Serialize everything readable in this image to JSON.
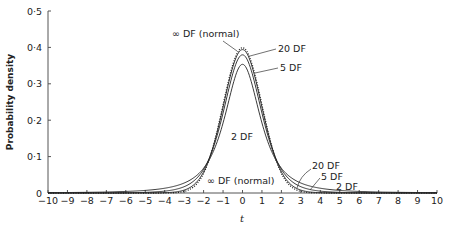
{
  "chart_data": {
    "type": "line",
    "title": "",
    "xlabel": "t",
    "ylabel": "Probability density",
    "xlim": [
      -10,
      10
    ],
    "ylim": [
      0,
      0.5
    ],
    "x_ticks": [
      "−10",
      "−9",
      "−8",
      "−7",
      "−6",
      "−5",
      "−4",
      "−3",
      "−2",
      "−1",
      "0",
      "1",
      "2",
      "3",
      "4",
      "5",
      "6",
      "7",
      "8",
      "9",
      "10"
    ],
    "y_ticks": [
      "0",
      "0·1",
      "0·2",
      "0·3",
      "0·4",
      "0·5"
    ],
    "grid": false,
    "legend": "none (inline annotations)",
    "series": [
      {
        "name": "∞ DF (normal)",
        "df": "inf",
        "peak": 0.399,
        "style": "dotted"
      },
      {
        "name": "20 DF",
        "df": 20,
        "peak": 0.394,
        "style": "solid"
      },
      {
        "name": "5 DF",
        "df": 5,
        "peak": 0.38,
        "style": "solid"
      },
      {
        "name": "2 DF",
        "df": 2,
        "peak": 0.354,
        "style": "solid"
      }
    ],
    "annotations": [
      {
        "text": "∞ DF (normal)",
        "position": "top, pointing to peak"
      },
      {
        "text": "20 DF",
        "position": "right of peak"
      },
      {
        "text": "5 DF",
        "position": "right of peak"
      },
      {
        "text": "2 DF",
        "position": "inside curve near center"
      },
      {
        "text": "∞ DF (normal)",
        "position": "near base, center"
      },
      {
        "text": "20 DF",
        "position": "right tail"
      },
      {
        "text": "5 DF",
        "position": "right tail"
      },
      {
        "text": "2 DF",
        "position": "right tail"
      }
    ]
  },
  "labels": {
    "ylabel": "Probability density",
    "xlabel": "t",
    "top_normal": "∞ DF (normal)",
    "top_20": "20 DF",
    "top_5": "5 DF",
    "mid_2": "2 DF",
    "base_normal": "∞ DF (normal)",
    "tail_20": "20 DF",
    "tail_5": "5 DF",
    "tail_2": "2 DF"
  }
}
